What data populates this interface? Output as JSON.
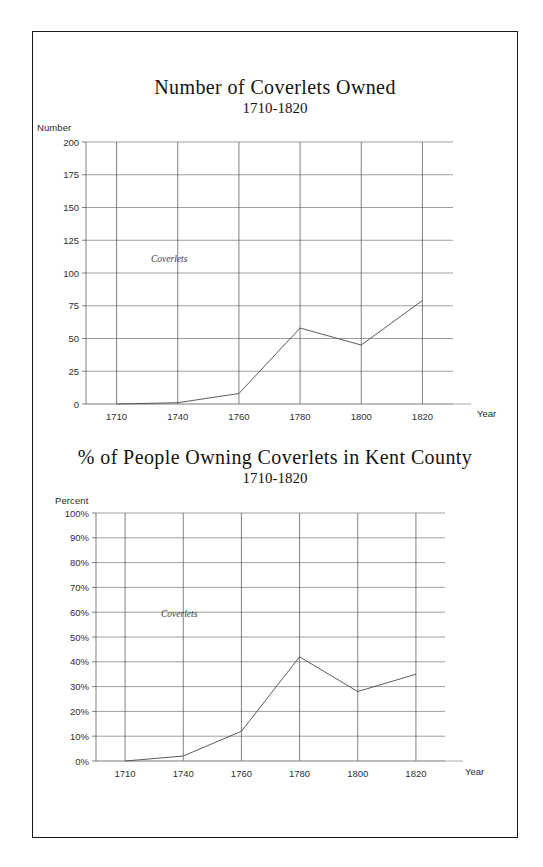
{
  "page": {
    "background": "#ffffff",
    "border_color": "#1a1a1a"
  },
  "charts": [
    {
      "id": "coverlets-owned",
      "title": "Number of Coverlets Owned",
      "subtitle": "1710-1820",
      "y_axis_name": "Number",
      "x_axis_name": "Year",
      "series_label": "Coverlets"
    },
    {
      "id": "percent-owning-coverlets",
      "title": "% of People Owning Coverlets in Kent County",
      "subtitle": "1710-1820",
      "y_axis_name": "Percent",
      "x_axis_name": "Year",
      "series_label": "Coverlets"
    }
  ],
  "chart_data": [
    {
      "type": "line",
      "title": "Number of Coverlets Owned",
      "subtitle": "1710-1820",
      "xlabel": "Year",
      "ylabel": "Number",
      "categories": [
        "1710",
        "1740",
        "1760",
        "1780",
        "1800",
        "1820"
      ],
      "x": [
        1710,
        1740,
        1760,
        1780,
        1800,
        1820
      ],
      "series": [
        {
          "name": "Coverlets",
          "values": [
            0,
            1,
            8,
            58,
            45,
            79
          ]
        }
      ],
      "ylim": [
        0,
        200
      ],
      "yticks": [
        0,
        25,
        50,
        75,
        100,
        125,
        150,
        175,
        200
      ],
      "ytick_labels": [
        "0",
        "25",
        "50",
        "75",
        "100",
        "125",
        "150",
        "175",
        "200"
      ],
      "grid": true,
      "legend": "inline-series-label"
    },
    {
      "type": "line",
      "title": "% of People Owning Coverlets in Kent County",
      "subtitle": "1710-1820",
      "xlabel": "Year",
      "ylabel": "Percent",
      "categories": [
        "1710",
        "1740",
        "1760",
        "1780",
        "1800",
        "1820"
      ],
      "x": [
        1710,
        1740,
        1760,
        1780,
        1800,
        1820
      ],
      "series": [
        {
          "name": "Coverlets",
          "values": [
            0,
            2,
            12,
            42,
            28,
            35
          ]
        }
      ],
      "ylim": [
        0,
        100
      ],
      "yticks": [
        0,
        10,
        20,
        30,
        40,
        50,
        60,
        70,
        80,
        90,
        100
      ],
      "ytick_labels": [
        "0%",
        "10%",
        "20%",
        "30%",
        "40%",
        "50%",
        "60%",
        "70%",
        "80%",
        "90%",
        "100%"
      ],
      "grid": true,
      "legend": "inline-series-label"
    }
  ]
}
